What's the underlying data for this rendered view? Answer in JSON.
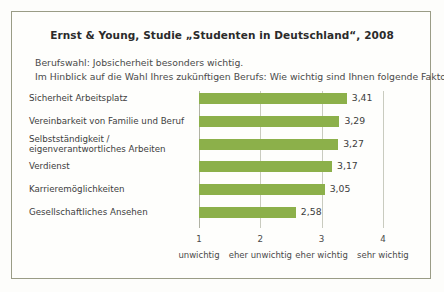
{
  "frame": {
    "border_color": "#9a9c86",
    "background": "#fefefc"
  },
  "header": {
    "title": "Ernst & Young, Studie „Studenten in Deutschland“, 2008",
    "subtitle_line1": "Berufswahl: Jobsicherheit besonders wichtig.",
    "subtitle_line2": "Im Hinblick auf die Wahl Ihres zukünftigen Berufs: Wie wichtig sind Ihnen folgende Faktoren?"
  },
  "colors": {
    "bar": "#8cb04a",
    "gridline": "#c9cbbf",
    "axis": "#b0b2a4",
    "text": "#3d3d3d"
  },
  "chart_data": {
    "type": "bar",
    "orientation": "horizontal",
    "title": "Ernst & Young, Studie „Studenten in Deutschland“, 2008",
    "subtitle": "Berufswahl: Jobsicherheit besonders wichtig. Im Hinblick auf die Wahl Ihres zukünftigen Berufs: Wie wichtig sind Ihnen folgende Faktoren?",
    "xlabel": "",
    "ylabel": "",
    "xlim": [
      1,
      4
    ],
    "grid": true,
    "legend": false,
    "categories": [
      "Sicherheit Arbeitsplatz",
      "Vereinbarkeit von Familie und Beruf",
      "Selbstständigkeit /\neigenverantwortliches Arbeiten",
      "Verdienst",
      "Karrieremöglichkeiten",
      "Gesellschaftliches Ansehen"
    ],
    "values": [
      3.41,
      3.29,
      3.27,
      3.17,
      3.05,
      2.58
    ],
    "value_labels": [
      "3,41",
      "3,29",
      "3,27",
      "3,17",
      "3,05",
      "2,58"
    ],
    "xticks": [
      1,
      2,
      3,
      4
    ],
    "xtick_labels": [
      "1",
      "2",
      "3",
      "4"
    ],
    "xtick_descriptions": [
      "unwichtig",
      "eher unwichtig",
      "eher wichtig",
      "sehr wichtig"
    ]
  },
  "bars": [
    {
      "label_line1": "Sicherheit Arbeitsplatz",
      "label_line2": "",
      "value_label": "3,41",
      "value": 3.41
    },
    {
      "label_line1": "Vereinbarkeit von Familie und Beruf",
      "label_line2": "",
      "value_label": "3,29",
      "value": 3.29
    },
    {
      "label_line1": "Selbstständigkeit /",
      "label_line2": "eigenverantwortliches Arbeiten",
      "value_label": "3,27",
      "value": 3.27
    },
    {
      "label_line1": "Verdienst",
      "label_line2": "",
      "value_label": "3,17",
      "value": 3.17
    },
    {
      "label_line1": "Karrieremöglichkeiten",
      "label_line2": "",
      "value_label": "3,05",
      "value": 3.05
    },
    {
      "label_line1": "Gesellschaftliches Ansehen",
      "label_line2": "",
      "value_label": "2,58",
      "value": 2.58
    }
  ],
  "axis": {
    "ticks": [
      {
        "num": "1",
        "text": "unwichtig"
      },
      {
        "num": "2",
        "text": "eher unwichtig"
      },
      {
        "num": "3",
        "text": "eher wichtig"
      },
      {
        "num": "4",
        "text": "sehr wichtig"
      }
    ]
  }
}
